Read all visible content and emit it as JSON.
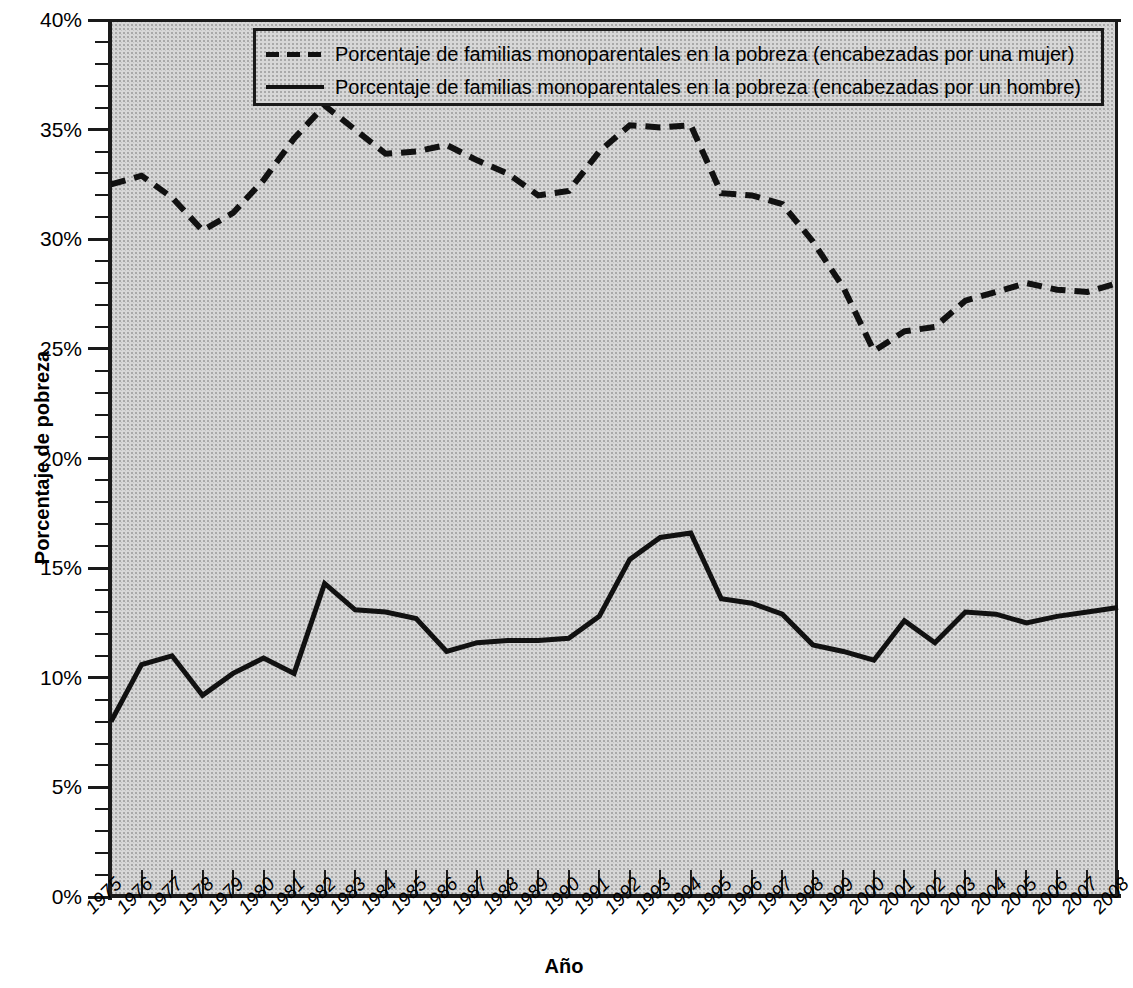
{
  "chart_data": {
    "type": "line",
    "title": "",
    "xlabel": "Año",
    "ylabel": "Porcentaje de pobreza",
    "xlim": [
      1975,
      2008
    ],
    "ylim": [
      0,
      40
    ],
    "y_tick_labels": [
      "0%",
      "5%",
      "10%",
      "15%",
      "20%",
      "25%",
      "30%",
      "35%",
      "40%"
    ],
    "y_tick_values": [
      0,
      5,
      10,
      15,
      20,
      25,
      30,
      35,
      40
    ],
    "y_minor_step": 1,
    "grid": false,
    "legend_position": "top-center",
    "categories": [
      1975,
      1976,
      1977,
      1978,
      1979,
      1980,
      1981,
      1982,
      1983,
      1984,
      1985,
      1986,
      1987,
      1988,
      1989,
      1990,
      1991,
      1992,
      1993,
      1994,
      1995,
      1996,
      1997,
      1998,
      1999,
      2000,
      2001,
      2002,
      2003,
      2004,
      2005,
      2006,
      2007,
      2008
    ],
    "x_tick_labels": [
      "1975",
      "1976",
      "1977",
      "1978",
      "1979",
      "1980",
      "1981",
      "1982",
      "1983",
      "1984",
      "1985",
      "1986",
      "1987",
      "1988",
      "1989",
      "1990",
      "1991",
      "1992",
      "1993",
      "1994",
      "1995",
      "1996",
      "1997",
      "1998",
      "1999",
      "2000",
      "2001",
      "2002",
      "2003",
      "2004",
      "2005",
      "2006",
      "2007",
      "2008"
    ],
    "series": [
      {
        "name": "Porcentaje de familias monoparentales en la pobreza (encabezadas por una mujer)",
        "style": "dashed",
        "color": "#111111",
        "values": [
          32.5,
          32.9,
          31.9,
          30.4,
          31.2,
          32.7,
          34.6,
          36.1,
          35.0,
          33.9,
          34.0,
          34.3,
          33.6,
          33.0,
          32.0,
          32.2,
          34.0,
          35.2,
          35.1,
          35.2,
          32.1,
          32.0,
          31.6,
          29.9,
          27.8,
          24.9,
          25.8,
          26.0,
          27.2,
          27.6,
          28.0,
          27.7,
          27.6,
          28.0
        ]
      },
      {
        "name": "Porcentaje de familias monoparentales en la pobreza (encabezadas por un hombre)",
        "style": "solid",
        "color": "#111111",
        "values": [
          8.0,
          10.6,
          11.0,
          9.2,
          10.2,
          10.9,
          10.2,
          14.3,
          13.1,
          13.0,
          12.7,
          11.2,
          11.6,
          11.7,
          11.7,
          11.8,
          12.8,
          15.4,
          16.4,
          16.6,
          13.6,
          13.4,
          12.9,
          11.5,
          11.2,
          10.8,
          12.6,
          11.6,
          13.0,
          12.9,
          12.5,
          12.8,
          13.0,
          13.2
        ]
      }
    ]
  },
  "legend": {
    "items": [
      {
        "swatch": "dashed-line-swatch",
        "label": "Porcentaje de familias monoparentales en la pobreza (encabezadas por una mujer)"
      },
      {
        "swatch": "solid-line-swatch",
        "label": "Porcentaje de familias monoparentales en la pobreza (encabezadas por un hombre)"
      }
    ]
  },
  "colors": {
    "plot_background": "#d7d7d7",
    "axis": "#1a1a1a",
    "series_line": "#111111",
    "page_background": "#ffffff"
  }
}
